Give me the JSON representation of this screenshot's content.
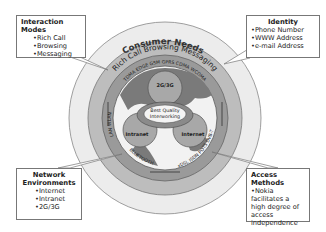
{
  "diagram": {
    "outer_ring": {
      "label": "Consumer Needs"
    },
    "middle_ring": {
      "labels": [
        "Rich Call",
        "Browsing",
        "Messaging"
      ]
    },
    "inner_ring": {
      "top_labels": "TDMA  EDGE  GSM  GPRS  CDMA  WCDMA",
      "left_labels": "LAN  WLAN",
      "bottom_left_labels": "BLUETOOTH",
      "bottom_right_labels": "xDSL  ISDN  POTS DVB-T"
    },
    "core": {
      "center_label_line1": "Best Quality",
      "center_label_line2": "Interworking",
      "nodes": [
        "2G/3G",
        "Intranet",
        "Internet"
      ]
    },
    "colors": {
      "outer_ring": "#ececec",
      "middle_ring": "#bdbdbd",
      "inner_ring": "#9a9a9a",
      "globe_land": "#7a7a7a",
      "globe_sea": "#f2f2f2",
      "node": "#a8a8a8",
      "arrow": "#8a8a8a"
    }
  },
  "callouts": {
    "interaction_modes": {
      "title": "Interaction Modes",
      "items": [
        "Rich Call",
        "Browsing",
        "Messaging"
      ]
    },
    "identity": {
      "title": "Identity",
      "items": [
        "Phone Number",
        "WWW Address",
        "e-mail Address"
      ]
    },
    "network_environments": {
      "title_line1": "Network",
      "title_line2": "Environments",
      "items": [
        "Internet",
        "Intranet",
        "2G/3G"
      ]
    },
    "access_methods": {
      "title": "Access Methods",
      "items": [
        "Nokia facilitates a high degree of access independence"
      ]
    }
  }
}
